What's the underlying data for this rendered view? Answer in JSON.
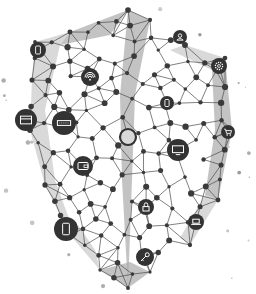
{
  "illustration": {
    "subject": "polygonal shield network with connected device icons",
    "colors": {
      "background": "#ffffff",
      "line": "#4a4a4a",
      "node": "#3a3a3a",
      "icon_bg": "#333333",
      "icon_fg": "#ffffff",
      "facet_light": "#c9c9c9",
      "facet_mid": "#a9a9a9",
      "dust": "#9a9a9a"
    },
    "icons": [
      {
        "name": "smartphone-icon",
        "cx": 38,
        "cy": 50,
        "r": 8
      },
      {
        "name": "user-icon",
        "cx": 180,
        "cy": 37,
        "r": 7
      },
      {
        "name": "wifi-icon",
        "cx": 90,
        "cy": 77,
        "r": 9
      },
      {
        "name": "gear-icon",
        "cx": 219,
        "cy": 66,
        "r": 8
      },
      {
        "name": "credit-card-icon",
        "cx": 26,
        "cy": 120,
        "r": 11
      },
      {
        "name": "keyboard-icon",
        "cx": 64,
        "cy": 123,
        "r": 12
      },
      {
        "name": "tablet-icon",
        "cx": 167,
        "cy": 103,
        "r": 7
      },
      {
        "name": "hub-ring-icon",
        "cx": 128,
        "cy": 137,
        "r": 8
      },
      {
        "name": "monitor-icon",
        "cx": 178,
        "cy": 150,
        "r": 11
      },
      {
        "name": "shopping-cart-icon",
        "cx": 228,
        "cy": 132,
        "r": 7
      },
      {
        "name": "wallet-icon",
        "cx": 83,
        "cy": 166,
        "r": 10
      },
      {
        "name": "lock-icon",
        "cx": 146,
        "cy": 207,
        "r": 8
      },
      {
        "name": "laptop-icon",
        "cx": 196,
        "cy": 222,
        "r": 8
      },
      {
        "name": "mobile-phone-icon",
        "cx": 66,
        "cy": 229,
        "r": 12
      },
      {
        "name": "key-icon",
        "cx": 145,
        "cy": 257,
        "r": 9
      }
    ]
  }
}
